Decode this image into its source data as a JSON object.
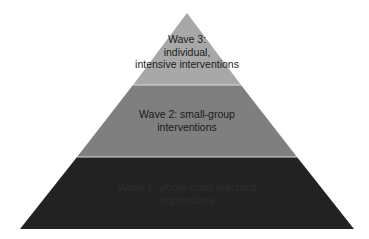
{
  "diagram": {
    "type": "pyramid",
    "levels": [
      {
        "id": "wave-3",
        "position": "top",
        "lines": [
          "Wave 3:",
          "individual,",
          "intensive interventions"
        ],
        "fill": "#a8a8a8"
      },
      {
        "id": "wave-2",
        "position": "middle",
        "lines": [
          "Wave 2: small-group",
          "interventions"
        ],
        "fill": "#7f7f7f"
      },
      {
        "id": "wave-1",
        "position": "bottom",
        "lines": [
          "Wave 1: whole-class teaching",
          "approaches"
        ],
        "fill": "#222222"
      }
    ],
    "separator_color": "#d9d9d9"
  }
}
